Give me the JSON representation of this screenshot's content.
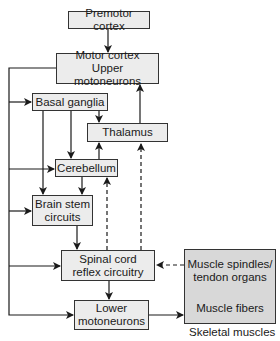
{
  "diagram": {
    "nodes": {
      "premotor": {
        "label": "Premotor cortex"
      },
      "motor": {
        "line1": "Motor cortex",
        "line2": "Upper motoneurons"
      },
      "basal": {
        "label": "Basal ganglia"
      },
      "thalamus": {
        "label": "Thalamus"
      },
      "cerebellum": {
        "label": "Cerebellum"
      },
      "brainstem": {
        "line1": "Brain stem",
        "line2": "circuits"
      },
      "spinal": {
        "line1": "Spinal cord",
        "line2": "reflex circuitry"
      },
      "lower": {
        "line1": "Lower",
        "line2": "motoneurons"
      },
      "muscle": {
        "top1": "Muscle spindles/",
        "top2": "tendon organs",
        "bottom": "Muscle fibers",
        "caption": "Skeletal muscles"
      }
    },
    "colors": {
      "box_fill": "#ececec",
      "muscle_fill": "#d8d8d8",
      "line": "#1a1a1a"
    },
    "edges": [
      {
        "from": "Premotor cortex",
        "to": "Motor cortex",
        "style": "solid"
      },
      {
        "from": "Motor cortex",
        "to": "Basal ganglia",
        "style": "solid"
      },
      {
        "from": "Motor cortex",
        "to": "Cerebellum",
        "style": "solid"
      },
      {
        "from": "Motor cortex",
        "to": "Brain stem circuits",
        "style": "solid"
      },
      {
        "from": "Motor cortex",
        "to": "Spinal cord reflex circuitry",
        "style": "solid"
      },
      {
        "from": "Motor cortex",
        "to": "Lower motoneurons",
        "style": "solid"
      },
      {
        "from": "Basal ganglia",
        "to": "Thalamus",
        "style": "solid"
      },
      {
        "from": "Basal ganglia",
        "to": "Cerebellum",
        "style": "solid"
      },
      {
        "from": "Basal ganglia",
        "to": "Brain stem circuits",
        "style": "solid"
      },
      {
        "from": "Thalamus",
        "to": "Motor cortex",
        "style": "solid"
      },
      {
        "from": "Cerebellum",
        "to": "Thalamus",
        "style": "solid"
      },
      {
        "from": "Cerebellum",
        "to": "Brain stem circuits",
        "style": "solid"
      },
      {
        "from": "Brain stem circuits",
        "to": "Spinal cord reflex circuitry",
        "style": "solid"
      },
      {
        "from": "Spinal cord reflex circuitry",
        "to": "Lower motoneurons",
        "style": "solid"
      },
      {
        "from": "Spinal cord reflex circuitry",
        "to": "Cerebellum",
        "style": "dashed"
      },
      {
        "from": "Spinal cord reflex circuitry",
        "to": "Thalamus",
        "style": "dashed"
      },
      {
        "from": "Muscle spindles/tendon organs",
        "to": "Spinal cord reflex circuitry",
        "style": "dashed"
      },
      {
        "from": "Lower motoneurons",
        "to": "Muscle fibers",
        "style": "solid"
      }
    ]
  }
}
